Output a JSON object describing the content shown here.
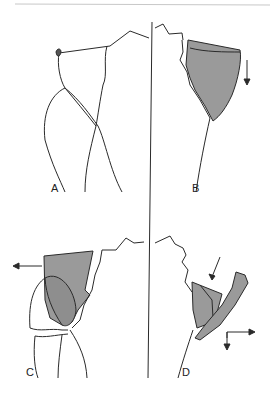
{
  "figure": {
    "panels": [
      {
        "id": "A",
        "label": "A",
        "description": "outline, no displacement"
      },
      {
        "id": "B",
        "label": "B",
        "description": "shaded fragment with downward arrow"
      },
      {
        "id": "C",
        "label": "C",
        "description": "shaded fragment with leftward arrow"
      },
      {
        "id": "D",
        "label": "D",
        "description": "shaded fragments with diagonal, rightward and downward arrows"
      }
    ],
    "colors": {
      "line": "#2a2a2a",
      "fragment_fill": "#9a9a9a",
      "background": "#ffffff",
      "rule": "#bbbbbb"
    }
  }
}
